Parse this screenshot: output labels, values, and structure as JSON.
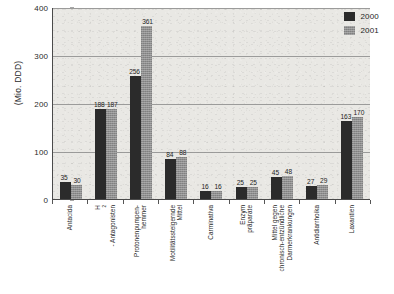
{
  "chart_data": {
    "type": "bar",
    "title": "",
    "xlabel": "",
    "ylabel": "(Mio. DDD)",
    "ylim": [
      0,
      400
    ],
    "yticks": [
      0,
      100,
      200,
      300,
      400
    ],
    "grid": true,
    "legend_position": "top-right",
    "categories": [
      "Antacida",
      "H2 - Antagonisten",
      "Protonenpumpen-hemmer",
      "Motilitätssteigernde Mittel",
      "Carminativa",
      "Enzympräparate",
      "Mittel gegen chronisch-entzündliche Darmerkrankungen",
      "Antidiarrhoika",
      "Laxantien"
    ],
    "category_lines": [
      [
        "Antacida"
      ],
      [
        "H2 - Antagonisten"
      ],
      [
        "Protonenpumpen-",
        "hemmer"
      ],
      [
        "Motilitätssteigernde",
        "Mittel"
      ],
      [
        "Carminativa"
      ],
      [
        "Enzym",
        "präparate"
      ],
      [
        "Mittel gegen",
        "chronisch-entzündliche",
        "Darmerkrankungen"
      ],
      [
        "Antidiarrhoika"
      ],
      [
        "Laxantien"
      ]
    ],
    "series": [
      {
        "name": "2000",
        "color": "#2b2b2b",
        "values": [
          35,
          188,
          256,
          84,
          16,
          25,
          45,
          27,
          163
        ]
      },
      {
        "name": "2001",
        "color": "#8e8e8e",
        "values": [
          30,
          187,
          361,
          88,
          16,
          25,
          48,
          29,
          170
        ]
      }
    ]
  },
  "legend": {
    "items": [
      {
        "label": "2000",
        "swatch": "dark-swatch"
      },
      {
        "label": "2001",
        "swatch": "gray-swatch"
      }
    ]
  },
  "axis": {
    "y_caption": "(Mio. DDD)",
    "y_tick_labels": [
      "400",
      "300",
      "200",
      "100",
      "0"
    ]
  }
}
